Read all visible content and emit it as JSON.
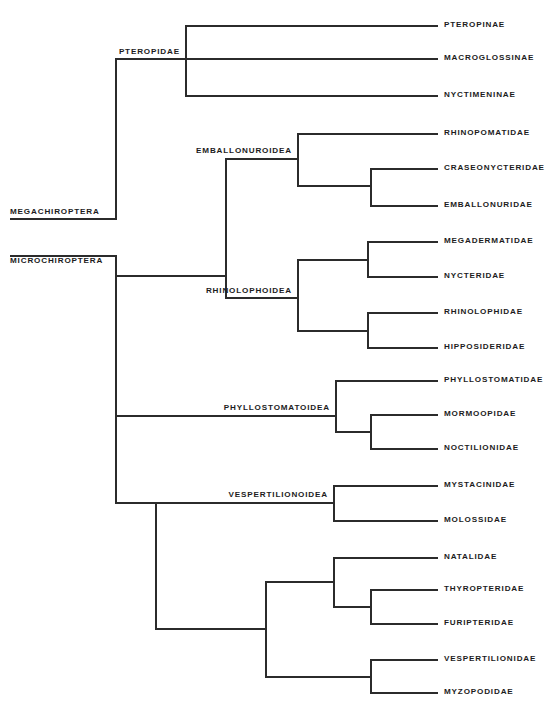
{
  "diagram": {
    "type": "cladogram",
    "line_color": "#2b2b2b",
    "background_color": "#ffffff",
    "width": 558,
    "height": 711
  },
  "terminal_taxa": [
    {
      "label": "PTEROPINAE",
      "tip_y": 25,
      "branch_x1": 408,
      "branch_x2": 438,
      "text_x": 444
    },
    {
      "label": "MACROGLOSSINAE",
      "tip_y": 58,
      "branch_x1": 408,
      "branch_x2": 438,
      "text_x": 444
    },
    {
      "label": "NYCTIMENINAE",
      "tip_y": 95,
      "branch_x1": 408,
      "branch_x2": 438,
      "text_x": 444
    },
    {
      "label": "RHINOPOMATIDAE",
      "tip_y": 133,
      "branch_x1": 408,
      "branch_x2": 438,
      "text_x": 444
    },
    {
      "label": "CRASEONYCTERIDAE",
      "tip_y": 168,
      "branch_x1": 408,
      "branch_x2": 438,
      "text_x": 444
    },
    {
      "label": "EMBALLONURIDAE",
      "tip_y": 205,
      "branch_x1": 408,
      "branch_x2": 438,
      "text_x": 444
    },
    {
      "label": "MEGADERMATIDAE",
      "tip_y": 241,
      "branch_x1": 408,
      "branch_x2": 438,
      "text_x": 444
    },
    {
      "label": "NYCTERIDAE",
      "tip_y": 276,
      "branch_x1": 408,
      "branch_x2": 438,
      "text_x": 444
    },
    {
      "label": "RHINOLOPHIDAE",
      "tip_y": 312,
      "branch_x1": 408,
      "branch_x2": 438,
      "text_x": 444
    },
    {
      "label": "HIPPOSIDERIDAE",
      "tip_y": 347,
      "branch_x1": 408,
      "branch_x2": 438,
      "text_x": 444
    },
    {
      "label": "PHYLLOSTOMATIDAE",
      "tip_y": 380,
      "branch_x1": 408,
      "branch_x2": 438,
      "text_x": 444
    },
    {
      "label": "MORMOOPIDAE",
      "tip_y": 414,
      "branch_x1": 408,
      "branch_x2": 438,
      "text_x": 444
    },
    {
      "label": "NOCTILIONIDAE",
      "tip_y": 448,
      "branch_x1": 408,
      "branch_x2": 438,
      "text_x": 444
    },
    {
      "label": "MYSTACINIDAE",
      "tip_y": 485,
      "branch_x1": 408,
      "branch_x2": 438,
      "text_x": 444
    },
    {
      "label": "MOLOSSIDAE",
      "tip_y": 520,
      "branch_x1": 408,
      "branch_x2": 438,
      "text_x": 444
    },
    {
      "label": "NATALIDAE",
      "tip_y": 557,
      "branch_x1": 408,
      "branch_x2": 438,
      "text_x": 444
    },
    {
      "label": "THYROPTERIDAE",
      "tip_y": 589,
      "branch_x1": 408,
      "branch_x2": 438,
      "text_x": 444
    },
    {
      "label": "FURIPTERIDAE",
      "tip_y": 623,
      "branch_x1": 408,
      "branch_x2": 438,
      "text_x": 444
    },
    {
      "label": "VESPERTILIONIDAE",
      "tip_y": 659,
      "branch_x1": 408,
      "branch_x2": 438,
      "text_x": 444
    },
    {
      "label": "MYZOPODIDAE",
      "tip_y": 692,
      "branch_x1": 408,
      "branch_x2": 438,
      "text_x": 444
    }
  ],
  "node_labels": [
    {
      "label": "PTEROPIDAE",
      "text_x": 180,
      "text_y": 52,
      "align": "right"
    },
    {
      "label": "MEGACHIROPTERA",
      "text_x": 10,
      "text_y": 212,
      "align": "left"
    },
    {
      "label": "MICROCHIROPTERA",
      "text_x": 10,
      "text_y": 261,
      "align": "left"
    },
    {
      "label": "EMBALLONUROIDEA",
      "text_x": 292,
      "text_y": 151,
      "align": "right"
    },
    {
      "label": "RHINOLOPHOIDEA",
      "text_x": 292,
      "text_y": 291,
      "align": "right"
    },
    {
      "label": "PHYLLOSTOMATOIDEA",
      "text_x": 330,
      "text_y": 408,
      "align": "right"
    },
    {
      "label": "VESPERTILIONOIDEA",
      "text_x": 328,
      "text_y": 495,
      "align": "right"
    }
  ],
  "horizontal_branches": [
    {
      "name": "pteropinae-branch",
      "x1": 185,
      "x2": 438,
      "y": 25
    },
    {
      "name": "macroglossinae-branch",
      "x1": 185,
      "x2": 438,
      "y": 58
    },
    {
      "name": "nyctimeninae-branch",
      "x1": 185,
      "x2": 438,
      "y": 95
    },
    {
      "name": "pteropidae-stem",
      "x1": 115,
      "x2": 185,
      "y": 58
    },
    {
      "name": "megachiroptera-stem",
      "x1": 10,
      "x2": 115,
      "y": 218
    },
    {
      "name": "microchiroptera-stem",
      "x1": 10,
      "x2": 115,
      "y": 255
    },
    {
      "name": "rhinopomatidae-branch",
      "x1": 297,
      "x2": 438,
      "y": 133
    },
    {
      "name": "craseonycteridae-branch",
      "x1": 370,
      "x2": 438,
      "y": 168
    },
    {
      "name": "emballonuridae-branch",
      "x1": 370,
      "x2": 438,
      "y": 205
    },
    {
      "name": "emballonuroid-inner",
      "x1": 297,
      "x2": 370,
      "y": 185
    },
    {
      "name": "emballonuroidea-stem",
      "x1": 225,
      "x2": 297,
      "y": 158
    },
    {
      "name": "megadermatidae-branch",
      "x1": 367,
      "x2": 438,
      "y": 241
    },
    {
      "name": "nycteridae-branch",
      "x1": 367,
      "x2": 438,
      "y": 276
    },
    {
      "name": "megaderm-nycteris-stem",
      "x1": 297,
      "x2": 367,
      "y": 259
    },
    {
      "name": "rhinolophidae-branch",
      "x1": 367,
      "x2": 438,
      "y": 312
    },
    {
      "name": "hipposideridae-branch",
      "x1": 367,
      "x2": 438,
      "y": 347
    },
    {
      "name": "rhinoloph-hippos-stem",
      "x1": 297,
      "x2": 367,
      "y": 330
    },
    {
      "name": "rhinolophoidea-stem",
      "x1": 225,
      "x2": 297,
      "y": 297
    },
    {
      "name": "embal-rhinoloph-stem",
      "x1": 115,
      "x2": 225,
      "y": 275
    },
    {
      "name": "phyllostomatidae-branch",
      "x1": 335,
      "x2": 438,
      "y": 380
    },
    {
      "name": "mormoopidae-branch",
      "x1": 370,
      "x2": 438,
      "y": 414
    },
    {
      "name": "noctilionidae-branch",
      "x1": 370,
      "x2": 438,
      "y": 448
    },
    {
      "name": "mormoop-noctil-stem",
      "x1": 335,
      "x2": 370,
      "y": 431
    },
    {
      "name": "phyllostomatoidea-stem",
      "x1": 115,
      "x2": 335,
      "y": 415
    },
    {
      "name": "mystacinidae-branch",
      "x1": 333,
      "x2": 438,
      "y": 485
    },
    {
      "name": "molossidae-branch",
      "x1": 333,
      "x2": 438,
      "y": 520
    },
    {
      "name": "mystac-moloss-stem",
      "x1": 155,
      "x2": 333,
      "y": 502
    },
    {
      "name": "natalidae-branch",
      "x1": 333,
      "x2": 438,
      "y": 557
    },
    {
      "name": "thyropteridae-branch",
      "x1": 370,
      "x2": 438,
      "y": 589
    },
    {
      "name": "furipteridae-branch",
      "x1": 370,
      "x2": 438,
      "y": 623
    },
    {
      "name": "thyrop-furip-stem",
      "x1": 333,
      "x2": 370,
      "y": 606
    },
    {
      "name": "natal-thyrop-furip-stem",
      "x1": 265,
      "x2": 333,
      "y": 581
    },
    {
      "name": "vespertilionidae-branch",
      "x1": 370,
      "x2": 438,
      "y": 659
    },
    {
      "name": "myzopodidae-branch",
      "x1": 370,
      "x2": 438,
      "y": 692
    },
    {
      "name": "vesper-myzopod-stem",
      "x1": 265,
      "x2": 370,
      "y": 676
    },
    {
      "name": "lower-vesper-stem",
      "x1": 155,
      "x2": 265,
      "y": 628
    },
    {
      "name": "vespertilionoidea-stem",
      "x1": 115,
      "x2": 155,
      "y": 502
    }
  ],
  "vertical_branches": [
    {
      "name": "pteropidae-node",
      "x": 185,
      "y1": 25,
      "y2": 95
    },
    {
      "name": "megachiroptera-node",
      "x": 115,
      "y1": 58,
      "y2": 218
    },
    {
      "name": "microchiroptera-node",
      "x": 115,
      "y1": 255,
      "y2": 415
    },
    {
      "name": "emballonuroid-node",
      "x": 297,
      "y1": 133,
      "y2": 185
    },
    {
      "name": "emballonuroid-inner-node",
      "x": 370,
      "y1": 168,
      "y2": 205
    },
    {
      "name": "emballonuroidea-node",
      "x": 225,
      "y1": 158,
      "y2": 275
    },
    {
      "name": "megaderm-nycteris-node",
      "x": 367,
      "y1": 241,
      "y2": 276
    },
    {
      "name": "rhinoloph-hippos-node",
      "x": 367,
      "y1": 312,
      "y2": 347
    },
    {
      "name": "rhinolophoidea-node",
      "x": 297,
      "y1": 259,
      "y2": 330
    },
    {
      "name": "rhinolophoidea-stem-v",
      "x": 225,
      "y1": 275,
      "y2": 297
    },
    {
      "name": "phyllostomatoid-node",
      "x": 335,
      "y1": 380,
      "y2": 431
    },
    {
      "name": "mormoop-noctil-node",
      "x": 370,
      "y1": 414,
      "y2": 448
    },
    {
      "name": "mystac-moloss-node",
      "x": 333,
      "y1": 485,
      "y2": 520
    },
    {
      "name": "thyrop-furip-node",
      "x": 370,
      "y1": 589,
      "y2": 623
    },
    {
      "name": "natal-group-node",
      "x": 333,
      "y1": 557,
      "y2": 606
    },
    {
      "name": "vesper-myzopod-node",
      "x": 370,
      "y1": 659,
      "y2": 692
    },
    {
      "name": "lower-vesper-node",
      "x": 265,
      "y1": 581,
      "y2": 676
    },
    {
      "name": "vespertilionoidea-node",
      "x": 155,
      "y1": 502,
      "y2": 628
    },
    {
      "name": "microchiroptera-lower",
      "x": 115,
      "y1": 415,
      "y2": 502
    }
  ]
}
